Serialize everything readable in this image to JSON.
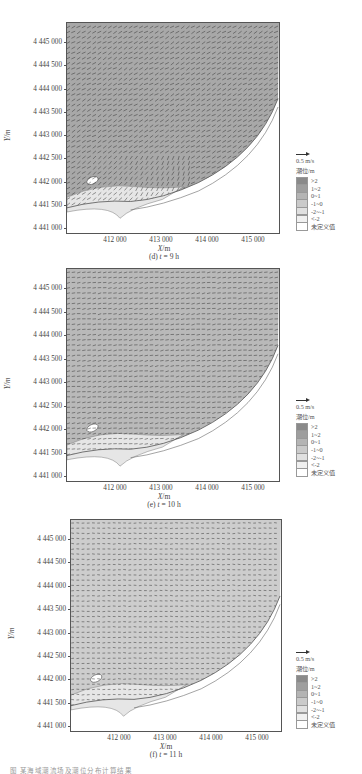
{
  "chart_data": [
    {
      "type": "heatmap",
      "subtype": "vector-field over filled contour (tidal level and current)",
      "title": "(d) t = 9 h",
      "xlabel": "X/m",
      "ylabel": "Y/m",
      "x_ticks": [
        "412 000",
        "413 000",
        "414 000",
        "415 000"
      ],
      "y_ticks": [
        "4 445 000",
        "4 444 500",
        "4 444 000",
        "4 443 500",
        "4 443 000",
        "4 442 500",
        "4 442 000",
        "4 441 500",
        "4 441 000"
      ],
      "xlim": [
        410950,
        415800
      ],
      "ylim": [
        4440950,
        4445300
      ],
      "vector_scale": "0.5 m/s",
      "dominant_flow": "southeast-to-northwest diagonal in open water; eddy circulation near southwestern shore",
      "dominant_level_class": "0~1 / 1~2",
      "legend_title": "潮位/m",
      "legend": [
        ">2",
        "1~2",
        "0~1",
        "-1~0",
        "-2~-1",
        "<-2",
        "未定义值"
      ]
    },
    {
      "type": "heatmap",
      "subtype": "vector-field over filled contour (tidal level and current)",
      "title": "(e) t = 10 h",
      "xlabel": "X/m",
      "ylabel": "Y/m",
      "x_ticks": [
        "412 000",
        "413 000",
        "414 000",
        "415 000"
      ],
      "y_ticks": [
        "4 445 000",
        "4 444 500",
        "4 444 000",
        "4 443 500",
        "4 443 000",
        "4 442 500",
        "4 442 000",
        "4 441 500",
        "4 441 000"
      ],
      "xlim": [
        410950,
        415800
      ],
      "ylim": [
        4440950,
        4445300
      ],
      "vector_scale": "0.5 m/s",
      "dominant_flow": "westward/northwestward, weakening; convergence near 413 500, 4 442 300",
      "dominant_level_class": "0~1",
      "legend_title": "潮位/m",
      "legend": [
        ">2",
        "1~2",
        "0~1",
        "-1~0",
        "-2~-1",
        "<-2",
        "未定义值"
      ]
    },
    {
      "type": "heatmap",
      "subtype": "vector-field over filled contour (tidal level and current)",
      "title": "(f) t = 11 h",
      "xlabel": "X/m",
      "ylabel": "Y/m",
      "x_ticks": [
        "412 000",
        "413 000",
        "414 000",
        "415 000"
      ],
      "y_ticks": [
        "4 445 000",
        "4 444 500",
        "4 444 000",
        "4 443 500",
        "4 443 000",
        "4 442 500",
        "4 442 000",
        "4 441 500",
        "4 441 000"
      ],
      "xlim": [
        410950,
        415800
      ],
      "ylim": [
        4440950,
        4445300
      ],
      "vector_scale": "0.5 m/s",
      "dominant_flow": "weak westward flow; convergence points near (414 400, 4 442 800) and (413 500, 4 442 300)",
      "dominant_level_class": "0~1 / -1~0",
      "legend_title": "潮位/m",
      "legend": [
        ">2",
        "1~2",
        "0~1",
        "-1~0",
        "-2~-1",
        "<-2",
        "未定义值"
      ]
    }
  ],
  "panels": [
    {
      "id": "d",
      "caption": "(d) t = 9 h",
      "caption_prefix": "(d) ",
      "caption_var": "t",
      "caption_suffix": " = 9 h",
      "fill": "#a8a8a8",
      "arrow_density": 1.0,
      "arrow_angle": -150
    },
    {
      "id": "e",
      "caption": "(e) t = 10 h",
      "caption_prefix": "(e) ",
      "caption_var": "t",
      "caption_suffix": " = 10 h",
      "fill": "#b9b9b9",
      "arrow_density": 0.8,
      "arrow_angle": -170
    },
    {
      "id": "f",
      "caption": "(f) t = 11 h",
      "caption_prefix": "(f) ",
      "caption_var": "t",
      "caption_suffix": " = 11 h",
      "fill": "#cdcdcd",
      "arrow_density": 0.6,
      "arrow_angle": 180
    }
  ],
  "axes": {
    "xlabel_var": "X",
    "xlabel_unit": "/m",
    "ylabel": "Y/m",
    "y_ticks": [
      "4 445 000",
      "4 444 500",
      "4 444 000",
      "4 443 500",
      "4 443 000",
      "4 442 500",
      "4 442 000",
      "4 441 500",
      "4 441 000"
    ],
    "x_ticks": [
      "412 000",
      "413 000",
      "414 000",
      "415 000"
    ]
  },
  "legend": {
    "scale_label": "0.5 m/s",
    "title": "潮位/m",
    "items": [
      {
        "label": ">2",
        "color": "#8a8a8a"
      },
      {
        "label": "1~2",
        "color": "#9e9e9e"
      },
      {
        "label": "0~1",
        "color": "#b4b4b4"
      },
      {
        "label": "-1~0",
        "color": "#cacaca"
      },
      {
        "label": "-2~-1",
        "color": "#e0e0e0"
      },
      {
        "label": "<-2",
        "color": "#f0f0f0"
      },
      {
        "label": "未定义值",
        "color": "#ffffff"
      }
    ]
  },
  "footnote": "图 某海域潮流场及潮位分布计算结果"
}
